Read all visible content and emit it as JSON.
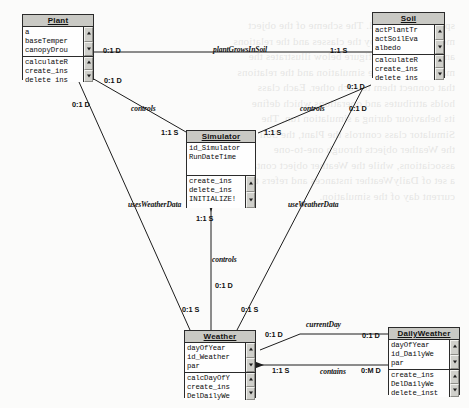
{
  "diagram": {
    "background_text": "sphere and the soil. The scheme of the object\nmodel is defined by the classes and the relations\namong them. The figure below illustrates the\nmain classes of the simulation and the relations\nthat connect them to each other. Each class\nholds attributes and operations which define\nits behaviour during a simulation run. The\nSimulator class controls the Plant, the Soil and\nthe Weather objects through one-to-one\nassociations, while the Weather object contains\na set of DailyWeather instances and refers to the\ncurrent day of the simulation."
  },
  "classes": [
    {
      "id": "plant",
      "name": "Plant",
      "attributes": [
        "a",
        "baseTemper",
        "canopyDrou"
      ],
      "operations": [
        "calculateR",
        "create_ins",
        "delete_ins"
      ]
    },
    {
      "id": "soil",
      "name": "Soil",
      "attributes": [
        "actPlantTr",
        "actSoilEva",
        "albedo"
      ],
      "operations": [
        "calculateR",
        "create_ins",
        "delete_ins"
      ]
    },
    {
      "id": "simulator",
      "name": "Simulator",
      "attributes": [
        "id_Simulator",
        "RunDateTime"
      ],
      "operations": [
        "create_ins",
        "delete_ins",
        "INITIALIZE!"
      ]
    },
    {
      "id": "weather",
      "name": "Weather",
      "attributes": [
        "dayOfYear",
        "id_Weather",
        "par"
      ],
      "operations": [
        "calcDayOfY",
        "create_ins",
        "DelDailyWe"
      ]
    },
    {
      "id": "dailyweather",
      "name": "DailyWeather",
      "attributes": [
        "dayOfYear",
        "id_DailyWe",
        "par"
      ],
      "operations": [
        "create_ins",
        "DelDailyWe",
        "delete_inst"
      ]
    }
  ],
  "relations": [
    {
      "id": "plant-grows-in-soil",
      "label": "plantGrowsInSoil",
      "from_mult": "0:1 D",
      "to_mult": "1:1 S"
    },
    {
      "id": "plant-controls",
      "label": "controls",
      "from_mult": "0:1 D",
      "to_mult": "1:1 S"
    },
    {
      "id": "soil-controls",
      "label": "controls",
      "from_mult": "0:1 D",
      "to_mult": "1:1 S"
    },
    {
      "id": "sim-weather-controls",
      "label": "controls",
      "from_mult": "1:1 S",
      "to_mult": "0:1 D"
    },
    {
      "id": "plant-uses-weather",
      "label": "usesWeatherData",
      "from_mult": "0:1 D",
      "to_mult": "0:1 S"
    },
    {
      "id": "soil-uses-weather",
      "label": "useWeatherData",
      "from_mult": "0:1 D",
      "to_mult": "0:1 S"
    },
    {
      "id": "current-day",
      "label": "currentDay",
      "from_mult": "0:1 D",
      "to_mult": "0:1 D"
    },
    {
      "id": "contains",
      "label": "contains",
      "from_mult": "1:1 S",
      "to_mult": "0:M D"
    }
  ]
}
